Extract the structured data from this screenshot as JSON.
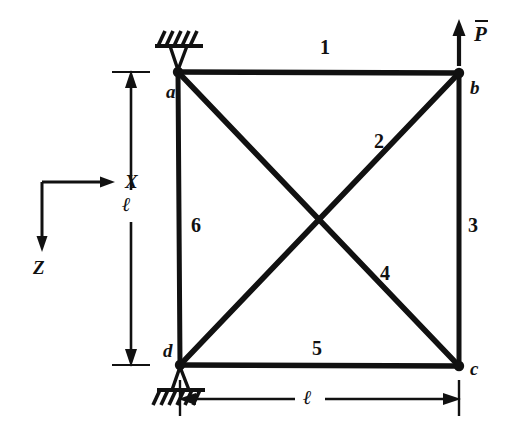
{
  "figure": {
    "type": "truss-structural-diagram",
    "nodes": [
      {
        "id": "a",
        "label": "a",
        "x": 178,
        "y": 72,
        "support": "pin"
      },
      {
        "id": "b",
        "label": "b",
        "x": 459,
        "y": 73,
        "support": "none"
      },
      {
        "id": "c",
        "label": "c",
        "x": 459,
        "y": 366,
        "support": "none"
      },
      {
        "id": "d",
        "label": "d",
        "x": 180,
        "y": 365,
        "support": "pin"
      }
    ],
    "members": [
      {
        "number": "1",
        "from": "a",
        "to": "b",
        "label_x": 320,
        "label_y": 37
      },
      {
        "number": "2",
        "from": "d",
        "to": "b",
        "label_x": 374,
        "label_y": 131
      },
      {
        "number": "3",
        "from": "b",
        "to": "c",
        "label_x": 468,
        "label_y": 215
      },
      {
        "number": "4",
        "from": "a",
        "to": "c",
        "label_x": 380,
        "label_y": 263
      },
      {
        "number": "5",
        "from": "d",
        "to": "c",
        "label_x": 312,
        "label_y": 338
      },
      {
        "number": "6",
        "from": "a",
        "to": "d",
        "label_x": 191,
        "label_y": 215
      }
    ],
    "load": {
      "symbol": "P",
      "has_overbar": true,
      "direction": "up",
      "applied_at": "b",
      "label_x": 474,
      "label_y": 24
    },
    "axes": {
      "x_label": "X",
      "z_label": "Z",
      "origin_x": 42,
      "origin_y": 182
    },
    "dimensions": [
      {
        "id": "vertical",
        "label": "ℓ",
        "orientation": "vertical",
        "label_x": 122,
        "label_y": 206
      },
      {
        "id": "horizontal",
        "label": "ℓ",
        "orientation": "horizontal",
        "label_x": 310,
        "label_y": 393
      }
    ],
    "colors": {
      "ink": "#111111",
      "background": "#ffffff"
    }
  }
}
